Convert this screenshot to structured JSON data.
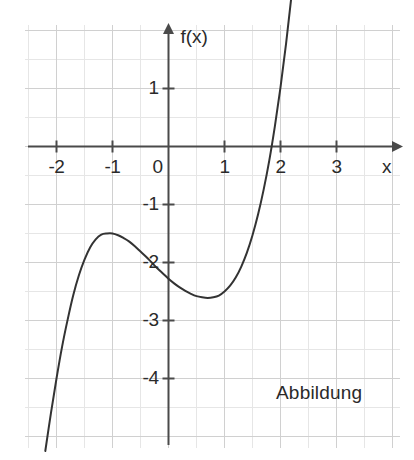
{
  "figure": {
    "caption": "Abbildung",
    "background_color": "#ffffff",
    "grid_color_minor": "#e6e6e6",
    "grid_color_major": "#d0d0d0",
    "axis_color": "#4a4a4a",
    "curve_color": "#333333",
    "text_color": "#2a2a2a"
  },
  "axes": {
    "x_label": "x",
    "y_label": "f(x)",
    "x_ticks": [
      {
        "value": -2,
        "label": "-2"
      },
      {
        "value": -1,
        "label": "-1"
      },
      {
        "value": 1,
        "label": "1"
      },
      {
        "value": 2,
        "label": "2"
      },
      {
        "value": 3,
        "label": "3"
      }
    ],
    "y_ticks": [
      {
        "value": 1,
        "label": "1"
      },
      {
        "value": -1,
        "label": "-1"
      },
      {
        "value": -2,
        "label": "-2"
      },
      {
        "value": -3,
        "label": "-3"
      },
      {
        "value": -4,
        "label": "-4"
      }
    ],
    "origin_label": "0"
  },
  "chart_data": {
    "type": "line",
    "title": "Abbildung",
    "xlabel": "x",
    "ylabel": "f(x)",
    "xlim": [
      -2.55,
      4.0
    ],
    "ylim": [
      -5.4,
      2.1
    ],
    "xticks": [
      -2,
      -1,
      0,
      1,
      2,
      3
    ],
    "yticks": [
      1,
      0,
      -1,
      -2,
      -3,
      -4
    ],
    "grid": true,
    "grid_step": 0.5,
    "legend": "none",
    "series": [
      {
        "name": "f(x)",
        "color": "#333333",
        "x": [
          -2.2,
          -2.1,
          -2.0,
          -1.9,
          -1.8,
          -1.7,
          -1.6,
          -1.5,
          -1.4,
          -1.3,
          -1.2,
          -1.1,
          -1.0,
          -0.9,
          -0.8,
          -0.7,
          -0.6,
          -0.5,
          -0.4,
          -0.3,
          -0.2,
          -0.1,
          0.0,
          0.1,
          0.2,
          0.3,
          0.4,
          0.5,
          0.6,
          0.7,
          0.8,
          0.9,
          1.0,
          1.1,
          1.2,
          1.3,
          1.4,
          1.5,
          1.6,
          1.7,
          1.8,
          1.9,
          2.0,
          2.1,
          2.2,
          2.3,
          2.35
        ],
        "y": [
          -5.25,
          -4.6,
          -4.0,
          -3.45,
          -2.98,
          -2.56,
          -2.22,
          -1.95,
          -1.74,
          -1.6,
          -1.52,
          -1.5,
          -1.5,
          -1.53,
          -1.58,
          -1.64,
          -1.72,
          -1.81,
          -1.9,
          -2.0,
          -2.1,
          -2.19,
          -2.28,
          -2.36,
          -2.43,
          -2.49,
          -2.54,
          -2.58,
          -2.6,
          -2.61,
          -2.6,
          -2.57,
          -2.5,
          -2.4,
          -2.26,
          -2.07,
          -1.83,
          -1.53,
          -1.17,
          -0.74,
          -0.24,
          0.35,
          1.02,
          1.78,
          2.63,
          3.57,
          4.05
        ]
      }
    ],
    "annotations": [
      {
        "text": "local maximum near x = -1, f(x) = -1.5",
        "x": -1.0,
        "y": -1.5
      },
      {
        "text": "local minimum near x = 0.7, f(x) = -2.6",
        "x": 0.7,
        "y": -2.6
      },
      {
        "text": "y-intercept f(0) = -2.3",
        "x": 0.0,
        "y": -2.28
      },
      {
        "text": "x-intercept at x = 2",
        "x": 2.0,
        "y": 0.0
      }
    ]
  }
}
